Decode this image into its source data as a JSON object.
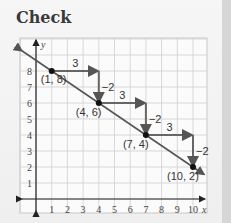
{
  "title": "Check",
  "chart_data": {
    "type": "line",
    "title": "Check",
    "xlabel": "x",
    "ylabel": "y",
    "xlim": [
      0,
      10
    ],
    "ylim": [
      0,
      8
    ],
    "x_ticks": [
      "1",
      "2",
      "3",
      "4",
      "5",
      "6",
      "7",
      "8",
      "9",
      "10"
    ],
    "y_ticks": [
      "1",
      "2",
      "3",
      "4",
      "5",
      "6",
      "7",
      "8"
    ],
    "grid": true,
    "line": {
      "slope": -0.6667,
      "description": "line through (1,8),(4,6),(7,4),(10,2) with arrows both ends"
    },
    "points": [
      {
        "x": 1,
        "y": 8,
        "label": "(1, 8)"
      },
      {
        "x": 4,
        "y": 6,
        "label": "(4, 6)"
      },
      {
        "x": 7,
        "y": 4,
        "label": "(7, 4)"
      },
      {
        "x": 10,
        "y": 2,
        "label": "(10, 2)"
      }
    ],
    "steps": [
      {
        "run": 3,
        "rise": -2,
        "run_label": "3",
        "rise_label": "−2"
      },
      {
        "run": 3,
        "rise": -2,
        "run_label": "3",
        "rise_label": "−2"
      },
      {
        "run": 3,
        "rise": -2,
        "run_label": "3",
        "rise_label": "−2"
      }
    ]
  }
}
